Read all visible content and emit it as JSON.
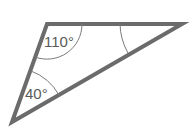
{
  "diagram": {
    "type": "triangle",
    "stroke_color": "#6b6b6b",
    "arc_color": "#7a7a7a",
    "vertices": {
      "top_left": [
        47,
        24
      ],
      "top_right": [
        182,
        24
      ],
      "bottom_left": [
        12,
        122
      ]
    },
    "angles": [
      {
        "vertex": "top_left",
        "label": "110°"
      },
      {
        "vertex": "bottom_left",
        "label": "40°"
      },
      {
        "vertex": "top_right",
        "label": ""
      }
    ]
  }
}
